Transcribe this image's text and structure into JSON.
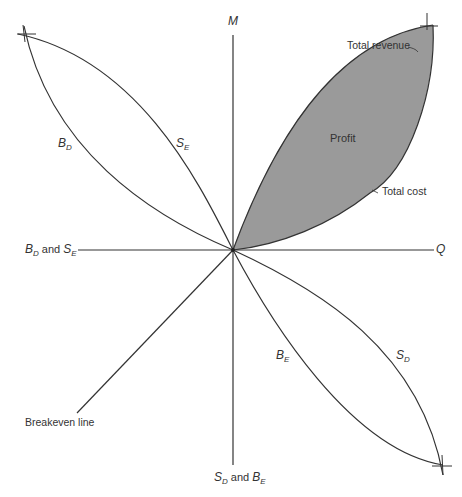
{
  "diagram": {
    "type": "four-quadrant breakeven diagram",
    "axes": {
      "vertical_top": "M",
      "horizontal_right": "Q",
      "horizontal_left": {
        "main": "B",
        "sub": "D",
        "joiner": "and",
        "main2": "S",
        "sub2": "E"
      },
      "vertical_bottom": {
        "main": "S",
        "sub": "D",
        "joiner": "and",
        "main2": "B",
        "sub2": "E"
      }
    },
    "quadrant_labels": {
      "upper_left_outer": {
        "main": "B",
        "sub": "D"
      },
      "upper_left_inner": {
        "main": "S",
        "sub": "E"
      },
      "lower_right_inner": {
        "main": "B",
        "sub": "E"
      },
      "lower_right_outer": {
        "main": "S",
        "sub": "D"
      },
      "upper_right_area": "Profit",
      "upper_right_top_curve": "Total revenue",
      "upper_right_bottom_curve": "Total cost",
      "lower_left_line": "Breakeven line"
    },
    "colors": {
      "line": "#333333",
      "profit_fill": "#9a9a9a",
      "background": "#ffffff"
    }
  }
}
